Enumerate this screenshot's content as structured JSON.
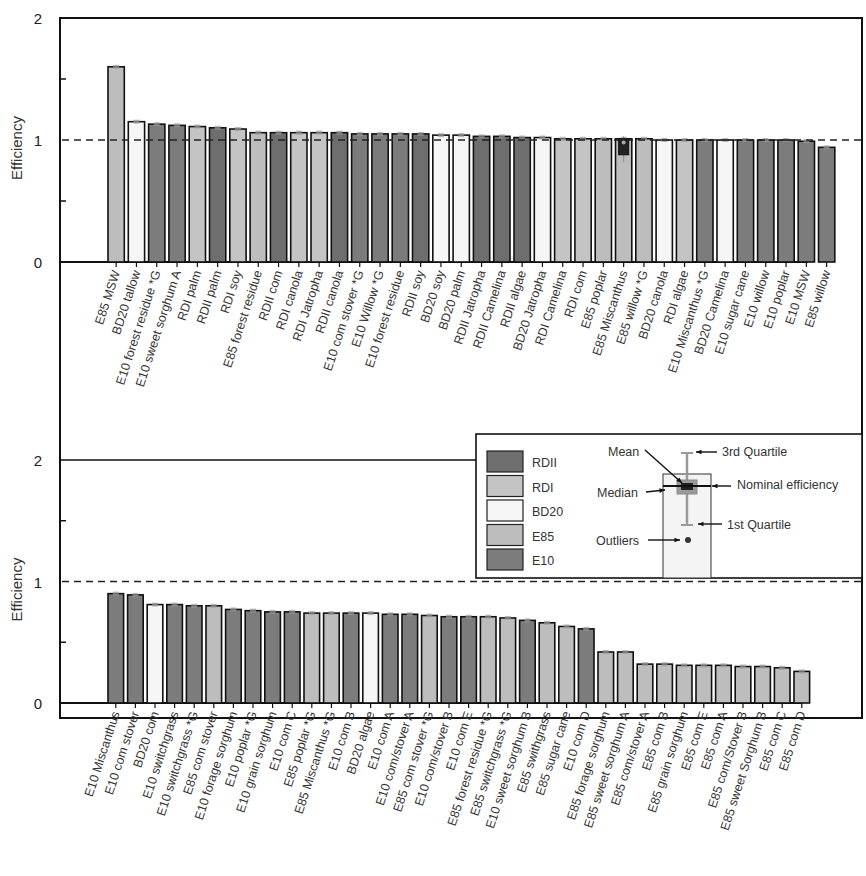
{
  "colors": {
    "RDII": "#6e6e6e",
    "RDI": "#c4c4c4",
    "BD20": "#f6f6f6",
    "E85": "#bdbdbd",
    "E10": "#7c7c7c"
  },
  "legend": {
    "entries": [
      "RDII",
      "RDI",
      "BD20",
      "E85",
      "E10"
    ],
    "box_annotations": {
      "mean": "Mean",
      "median": "Median",
      "q3": "3rd Quartile",
      "q1": "1st Quartile",
      "nominal": "Nominal efficiency",
      "outliers": "Outliers"
    }
  },
  "chart_data": [
    {
      "type": "bar",
      "title": "",
      "xlabel": "",
      "ylabel": "Efficiency",
      "ylim": [
        0,
        2
      ],
      "yticks": [
        "0",
        "1",
        "2"
      ],
      "reference_line": 1,
      "grid": false,
      "categories": [
        "E85 MSW",
        "BD20 tallow",
        "E10 forest residue *G",
        "E10 sweet sorghum A",
        "RDI palm",
        "RDII palm",
        "RDI soy",
        "E85 forest residue",
        "RDII com",
        "RDI canola",
        "RDI Jatropha",
        "RDII canola",
        "E10 com stover *G",
        "E10 Willow *G",
        "E10 forest residue",
        "RDII soy",
        "BD20 soy",
        "BD20 palm",
        "RDII Jatropha",
        "RDII Camelina",
        "RDII algae",
        "BD20 Jatropha",
        "RDI Camelina",
        "RDI com",
        "E85 poplar",
        "E85 Miscanthus",
        "E85 willow *G",
        "BD20 canola",
        "RDI algae",
        "E10 Miscanthus *G",
        "BD20 Camelina",
        "E10 sugar cane",
        "E10 willow",
        "E10 poplar",
        "E10 MSW",
        "E85 willow"
      ],
      "groups": [
        "E85",
        "BD20",
        "E10",
        "E10",
        "RDI",
        "RDII",
        "RDI",
        "E85",
        "RDII",
        "RDI",
        "RDI",
        "RDII",
        "E10",
        "E10",
        "E10",
        "RDII",
        "BD20",
        "BD20",
        "RDII",
        "RDII",
        "RDII",
        "BD20",
        "RDI",
        "RDI",
        "E85",
        "E85",
        "E85",
        "BD20",
        "RDI",
        "E10",
        "BD20",
        "E10",
        "E10",
        "E10",
        "E10",
        "E10"
      ],
      "values": [
        1.6,
        1.15,
        1.13,
        1.12,
        1.11,
        1.1,
        1.09,
        1.06,
        1.06,
        1.06,
        1.06,
        1.06,
        1.05,
        1.05,
        1.05,
        1.05,
        1.04,
        1.04,
        1.03,
        1.03,
        1.02,
        1.02,
        1.01,
        1.01,
        1.01,
        1.01,
        1.01,
        1.0,
        1.0,
        1.0,
        1.0,
        1.0,
        1.0,
        1.0,
        0.99,
        0.94
      ]
    },
    {
      "type": "bar",
      "title": "",
      "xlabel": "",
      "ylabel": "Efficiency",
      "ylim": [
        0,
        2
      ],
      "yticks": [
        "0",
        "1",
        "2"
      ],
      "reference_line": 1,
      "grid": false,
      "categories": [
        "E10 Miscanthus",
        "E10 com stover",
        "BD20 com",
        "E10 switchgrass",
        "E10 switchgrass *G",
        "E85 com stover",
        "E10 forage sorghum",
        "E10 poplar *G",
        "E10 grain sorghum",
        "E10 com C",
        "E85 poplar *G",
        "E85 Miscanthus *G",
        "E10 com B",
        "BD20 algae",
        "E10 com A",
        "E10 com/stover A",
        "E85 com stover *G",
        "E10 com/stover B",
        "E10 com E",
        "E85 forest residue *G",
        "E85 switchgrass *G",
        "E10 sweet sorghum B",
        "E85 swithgrass",
        "E85 sugar cane",
        "E10 com D",
        "E85 forage sorghum",
        "E85 sweet sorghum A",
        "E85 com/stover A",
        "E85 com B",
        "E85 grain sorghum",
        "E85 com E",
        "E85 com A",
        "E85 com/Stover B",
        "E85 sweet Sorghum B",
        "E85 com C",
        "E85 com D"
      ],
      "groups": [
        "E10",
        "E10",
        "BD20",
        "E10",
        "E10",
        "E85",
        "E10",
        "E10",
        "E10",
        "E10",
        "E85",
        "E85",
        "E10",
        "BD20",
        "E10",
        "E10",
        "E85",
        "E10",
        "E10",
        "E85",
        "E85",
        "E10",
        "E85",
        "E85",
        "E10",
        "E85",
        "E85",
        "E85",
        "E85",
        "E85",
        "E85",
        "E85",
        "E85",
        "E85",
        "E85",
        "E85"
      ],
      "values": [
        0.9,
        0.89,
        0.81,
        0.81,
        0.8,
        0.8,
        0.77,
        0.76,
        0.75,
        0.75,
        0.74,
        0.74,
        0.74,
        0.74,
        0.73,
        0.73,
        0.72,
        0.71,
        0.71,
        0.71,
        0.7,
        0.68,
        0.66,
        0.63,
        0.61,
        0.42,
        0.42,
        0.32,
        0.32,
        0.31,
        0.31,
        0.31,
        0.3,
        0.3,
        0.29,
        0.26
      ]
    }
  ]
}
